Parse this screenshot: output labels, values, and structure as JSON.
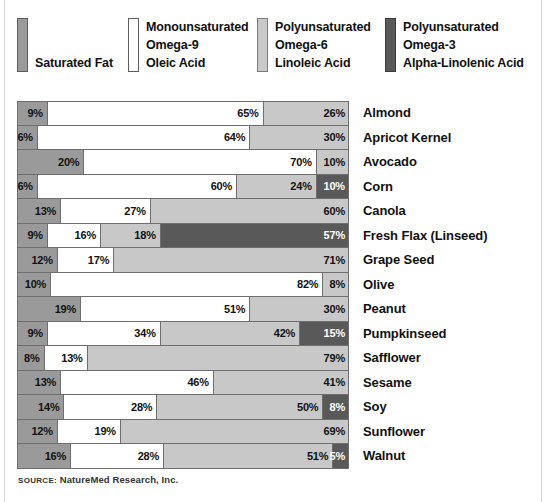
{
  "legend": {
    "items": [
      {
        "name": "saturated-fat",
        "swatch_color": "#9a9a9a",
        "lines": [
          "",
          "",
          "Saturated Fat"
        ]
      },
      {
        "name": "omega-9",
        "swatch_color": "#ffffff",
        "lines": [
          "Monounsaturated",
          "Omega-9",
          "Oleic Acid"
        ]
      },
      {
        "name": "omega-6",
        "swatch_color": "#c8c8c8",
        "lines": [
          "Polyunsaturated",
          "Omega-6",
          "Linoleic Acid"
        ]
      },
      {
        "name": "omega-3",
        "swatch_color": "#595959",
        "lines": [
          "Polyunsaturated",
          "Omega-3",
          "Alpha-Linolenic Acid"
        ]
      }
    ]
  },
  "source": {
    "prefix": "SOURCE:",
    "text": " NatureMed Research, Inc."
  },
  "chart_data": {
    "type": "bar",
    "title": "",
    "subtype": "stacked-horizontal-100%",
    "xlabel": "",
    "ylabel": "",
    "xlim": [
      0,
      100
    ],
    "grid": false,
    "legend_position": "top",
    "unit": "%",
    "series": [
      {
        "name": "Saturated Fat",
        "key": "sat",
        "color": "#9a9a9a",
        "values": [
          9,
          6,
          20,
          6,
          13,
          9,
          12,
          10,
          19,
          9,
          8,
          13,
          14,
          12,
          16
        ]
      },
      {
        "name": "Monounsaturated Omega-9 Oleic Acid",
        "key": "o9",
        "color": "#ffffff",
        "values": [
          65,
          64,
          70,
          60,
          27,
          16,
          17,
          82,
          51,
          34,
          13,
          46,
          28,
          19,
          28
        ]
      },
      {
        "name": "Polyunsaturated Omega-6 Linoleic Acid",
        "key": "o6",
        "color": "#c8c8c8",
        "values": [
          26,
          30,
          10,
          24,
          60,
          18,
          71,
          8,
          30,
          42,
          79,
          41,
          50,
          69,
          51
        ]
      },
      {
        "name": "Polyunsaturated Omega-3 Alpha-Linolenic Acid",
        "key": "o3",
        "color": "#595959",
        "values": [
          0,
          0,
          0,
          10,
          0,
          57,
          0,
          0,
          0,
          15,
          0,
          0,
          8,
          0,
          5
        ]
      }
    ],
    "categories": [
      "Almond",
      "Apricot Kernel",
      "Avocado",
      "Corn",
      "Canola",
      "Fresh Flax (Linseed)",
      "Grape Seed",
      "Olive",
      "Peanut",
      "Pumpkinseed",
      "Safflower",
      "Sesame",
      "Soy",
      "Sunflower",
      "Walnut"
    ]
  },
  "rows": [
    {
      "label": "Almond",
      "segments": [
        {
          "k": "sat",
          "v": 9,
          "t": "9%"
        },
        {
          "k": "o9",
          "v": 65,
          "t": "65%"
        },
        {
          "k": "o6",
          "v": 26,
          "t": "26%"
        }
      ]
    },
    {
      "label": "Apricot Kernel",
      "segments": [
        {
          "k": "sat",
          "v": 6,
          "t": "6%"
        },
        {
          "k": "o9",
          "v": 64,
          "t": "64%"
        },
        {
          "k": "o6",
          "v": 30,
          "t": "30%"
        }
      ]
    },
    {
      "label": "Avocado",
      "segments": [
        {
          "k": "sat",
          "v": 20,
          "t": "20%"
        },
        {
          "k": "o9",
          "v": 70,
          "t": "70%"
        },
        {
          "k": "o6",
          "v": 10,
          "t": "10%"
        }
      ]
    },
    {
      "label": "Corn",
      "segments": [
        {
          "k": "sat",
          "v": 6,
          "t": "6%"
        },
        {
          "k": "o9",
          "v": 60,
          "t": "60%"
        },
        {
          "k": "o6",
          "v": 24,
          "t": "24%"
        },
        {
          "k": "o3",
          "v": 10,
          "t": "10%"
        }
      ]
    },
    {
      "label": "Canola",
      "segments": [
        {
          "k": "sat",
          "v": 13,
          "t": "13%"
        },
        {
          "k": "o9",
          "v": 27,
          "t": "27%"
        },
        {
          "k": "o6",
          "v": 60,
          "t": "60%"
        }
      ]
    },
    {
      "label": "Fresh Flax (Linseed)",
      "segments": [
        {
          "k": "sat",
          "v": 9,
          "t": "9%"
        },
        {
          "k": "o9",
          "v": 16,
          "t": "16%"
        },
        {
          "k": "o6",
          "v": 18,
          "t": "18%"
        },
        {
          "k": "o3",
          "v": 57,
          "t": "57%"
        }
      ]
    },
    {
      "label": "Grape Seed",
      "segments": [
        {
          "k": "sat",
          "v": 12,
          "t": "12%"
        },
        {
          "k": "o9",
          "v": 17,
          "t": "17%"
        },
        {
          "k": "o6",
          "v": 71,
          "t": "71%"
        }
      ]
    },
    {
      "label": "Olive",
      "segments": [
        {
          "k": "sat",
          "v": 10,
          "t": "10%"
        },
        {
          "k": "o9",
          "v": 82,
          "t": "82%"
        },
        {
          "k": "o6",
          "v": 8,
          "t": "8%"
        }
      ]
    },
    {
      "label": "Peanut",
      "segments": [
        {
          "k": "sat",
          "v": 19,
          "t": "19%"
        },
        {
          "k": "o9",
          "v": 51,
          "t": "51%"
        },
        {
          "k": "o6",
          "v": 30,
          "t": "30%"
        }
      ]
    },
    {
      "label": "Pumpkinseed",
      "segments": [
        {
          "k": "sat",
          "v": 9,
          "t": "9%"
        },
        {
          "k": "o9",
          "v": 34,
          "t": "34%"
        },
        {
          "k": "o6",
          "v": 42,
          "t": "42%"
        },
        {
          "k": "o3",
          "v": 15,
          "t": "15%"
        }
      ]
    },
    {
      "label": "Safflower",
      "segments": [
        {
          "k": "sat",
          "v": 8,
          "t": "8%"
        },
        {
          "k": "o9",
          "v": 13,
          "t": "13%"
        },
        {
          "k": "o6",
          "v": 79,
          "t": "79%"
        }
      ]
    },
    {
      "label": "Sesame",
      "segments": [
        {
          "k": "sat",
          "v": 13,
          "t": "13%"
        },
        {
          "k": "o9",
          "v": 46,
          "t": "46%"
        },
        {
          "k": "o6",
          "v": 41,
          "t": "41%"
        }
      ]
    },
    {
      "label": "Soy",
      "segments": [
        {
          "k": "sat",
          "v": 14,
          "t": "14%"
        },
        {
          "k": "o9",
          "v": 28,
          "t": "28%"
        },
        {
          "k": "o6",
          "v": 50,
          "t": "50%"
        },
        {
          "k": "o3",
          "v": 8,
          "t": "8%"
        }
      ]
    },
    {
      "label": "Sunflower",
      "segments": [
        {
          "k": "sat",
          "v": 12,
          "t": "12%"
        },
        {
          "k": "o9",
          "v": 19,
          "t": "19%"
        },
        {
          "k": "o6",
          "v": 69,
          "t": "69%"
        }
      ]
    },
    {
      "label": "Walnut",
      "segments": [
        {
          "k": "sat",
          "v": 16,
          "t": "16%"
        },
        {
          "k": "o9",
          "v": 28,
          "t": "28%"
        },
        {
          "k": "o6",
          "v": 51,
          "t": "51%"
        },
        {
          "k": "o3",
          "v": 5,
          "t": "5%"
        }
      ]
    }
  ]
}
